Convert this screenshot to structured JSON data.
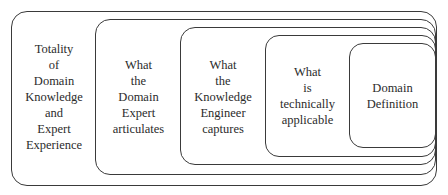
{
  "diagram": {
    "type": "nested-sets",
    "levels": [
      {
        "id": "totality",
        "lines": [
          "Totality",
          "of",
          "Domain",
          "Knowledge",
          "and",
          "Expert",
          "Experience"
        ]
      },
      {
        "id": "expert-articulates",
        "lines": [
          "What",
          "the",
          "Domain",
          "Expert",
          "articulates"
        ]
      },
      {
        "id": "engineer-captures",
        "lines": [
          "What",
          "the",
          "Knowledge",
          "Engineer",
          "captures"
        ]
      },
      {
        "id": "technically-applicable",
        "lines": [
          "What",
          "is",
          "technically",
          "applicable"
        ]
      },
      {
        "id": "domain-definition",
        "lines": [
          "Domain",
          "Definition"
        ]
      }
    ]
  }
}
